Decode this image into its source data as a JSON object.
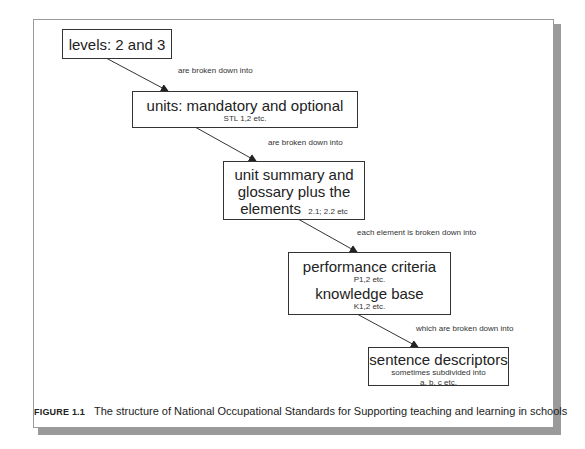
{
  "diagram": {
    "nodes": [
      {
        "id": "levels",
        "title": "levels: 2 and 3",
        "sub": ""
      },
      {
        "id": "units",
        "title": "units: mandatory and optional",
        "sub": "STL 1,2 etc."
      },
      {
        "id": "unit-summary",
        "title_lines": [
          "unit summary and",
          "glossary plus the"
        ],
        "last_line": "elements",
        "last_suffix": "2.1; 2.2 etc"
      },
      {
        "id": "performance",
        "title": "performance criteria",
        "sub": "P1,2 etc.",
        "title2": "knowledge base",
        "sub2": "K1,2 etc."
      },
      {
        "id": "sentence",
        "title": "sentence descriptors",
        "sub": "sometimes subdivided into",
        "sub2": "a, b, c etc."
      }
    ],
    "edges": [
      {
        "from": "levels",
        "to": "units",
        "label": "are broken down into"
      },
      {
        "from": "units",
        "to": "unit-summary",
        "label": "are broken down into"
      },
      {
        "from": "unit-summary",
        "to": "performance",
        "label": "each element is broken down into"
      },
      {
        "from": "performance",
        "to": "sentence",
        "label": "which are broken down into"
      }
    ]
  },
  "caption": {
    "figure_label": "FIGURE 1.1",
    "text": "The structure of National Occupational Standards for Supporting teaching and learning in schools"
  }
}
